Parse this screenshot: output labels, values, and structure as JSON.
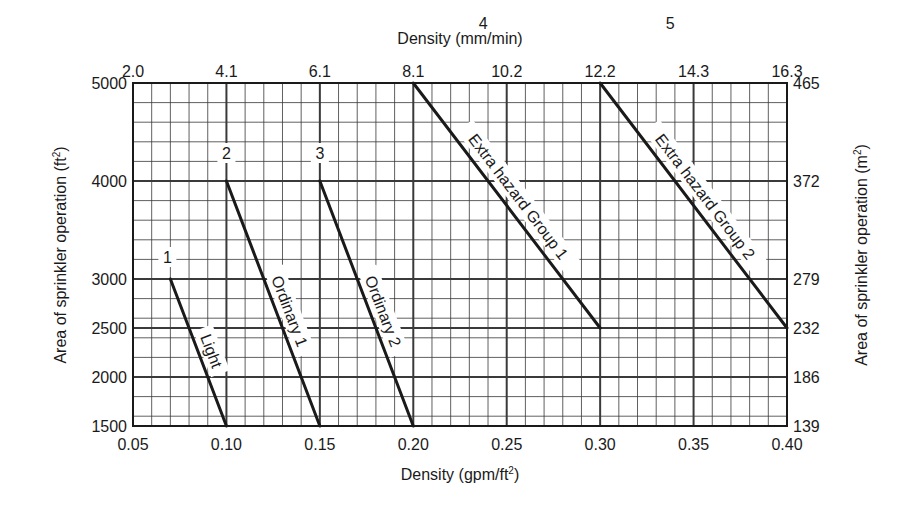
{
  "chart_data": {
    "type": "line",
    "title": "",
    "xlabel": "Density (gpm/ft²)",
    "xlabel_top": "Density (mm/min)",
    "ylabel": "Area of sprinkler operation (ft²)",
    "ylabel_right": "Area of sprinkler operation (m²)",
    "xlim": [
      0.05,
      0.4
    ],
    "ylim": [
      1500,
      5000
    ],
    "grid": true,
    "x_ticks": [
      0.05,
      0.1,
      0.15,
      0.2,
      0.25,
      0.3,
      0.35,
      0.4
    ],
    "x_tick_labels": [
      "0.05",
      "0.10",
      "0.15",
      "0.20",
      "0.25",
      "0.30",
      "0.35",
      "0.40"
    ],
    "x_top_tick_labels": [
      "2.0",
      "4.1",
      "6.1",
      "8.1",
      "10.2",
      "12.2",
      "14.3",
      "16.3"
    ],
    "y_ticks": [
      1500,
      2000,
      2500,
      3000,
      4000,
      5000
    ],
    "y_tick_labels": [
      "1500",
      "2000",
      "2500",
      "3000",
      "4000",
      "5000"
    ],
    "y_right_tick_labels": [
      "139",
      "186",
      "232",
      "279",
      "372",
      "465"
    ],
    "series": [
      {
        "name": "Light",
        "number": "1",
        "x": [
          0.07,
          0.1
        ],
        "y": [
          3000,
          1500
        ]
      },
      {
        "name": "Ordinary 1",
        "number": "2",
        "x": [
          0.1,
          0.15
        ],
        "y": [
          4000,
          1500
        ]
      },
      {
        "name": "Ordinary 2",
        "number": "3",
        "x": [
          0.15,
          0.2
        ],
        "y": [
          4000,
          1500
        ]
      },
      {
        "name": "Extra hazard Group 1",
        "number": "4",
        "x": [
          0.2,
          0.3
        ],
        "y": [
          5000,
          2500
        ]
      },
      {
        "name": "Extra hazard Group 2",
        "number": "5",
        "x": [
          0.3,
          0.4
        ],
        "y": [
          5000,
          2500
        ]
      }
    ]
  },
  "labels": {
    "top_axis_title": "Density (mm/min)",
    "bottom_axis_title": "Density (gpm/ft",
    "bottom_axis_sup": "2",
    "bottom_axis_close": ")",
    "left_axis_title": "Area of sprinkler operation (ft",
    "left_axis_sup": "2",
    "left_axis_close": ")",
    "right_axis_title": "Area of sprinkler operation (m",
    "right_axis_sup": "2",
    "right_axis_close": ")"
  },
  "colors": {
    "line": "#1a1a1a",
    "grid": "#3a3a3a",
    "background": "#ffffff"
  }
}
